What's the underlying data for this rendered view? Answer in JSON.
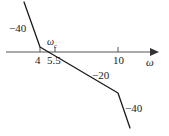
{
  "chart_data": {
    "type": "line",
    "title": "",
    "subtitle": "",
    "xlabel": "ω",
    "ylabel": "",
    "grid": false,
    "legend": null,
    "x_ticks": [
      {
        "value": 4,
        "label": "4"
      },
      {
        "value": 5.5,
        "label": "5.5"
      },
      {
        "value": 10,
        "label": "10"
      }
    ],
    "y_ticks": [],
    "annotations": [
      {
        "id": "slope-first",
        "label": "−40",
        "meaning": "-40 dB/dec slope of first asymptote segment",
        "px": {
          "x": 9,
          "y": 23
        }
      },
      {
        "id": "crossover",
        "label": "ωc",
        "meaning": "gain crossover frequency marker",
        "px": {
          "x": 47,
          "y": 37
        }
      },
      {
        "id": "slope-second",
        "label": "−20",
        "meaning": "-20 dB/dec slope of middle asymptote segment",
        "px": {
          "x": 92,
          "y": 70
        }
      },
      {
        "id": "slope-third",
        "label": "−40",
        "meaning": "-40 dB/dec slope of final asymptote segment",
        "px": {
          "x": 125,
          "y": 103
        }
      },
      {
        "id": "axis-name",
        "label": "ω",
        "meaning": "frequency axis label",
        "px": {
          "x": 146,
          "y": 57
        }
      }
    ],
    "series": [
      {
        "name": "magnitude-asymptote",
        "breakpoints": [
          {
            "omega": 2.6,
            "note": "segment start (top left)",
            "px": {
              "x": 24,
              "y": 2
            }
          },
          {
            "omega": 4,
            "note": "corner at ω = 4",
            "px": {
              "x": 40,
              "y": 47
            }
          },
          {
            "omega": 10,
            "note": "corner at ω = 10",
            "px": {
              "x": 118,
              "y": 93
            }
          },
          {
            "omega": 13.5,
            "note": "segment end (bottom right)",
            "px": {
              "x": 130,
              "y": 128
            }
          }
        ],
        "segment_slopes": [
          "-40",
          "-20",
          "-40"
        ]
      }
    ],
    "axis_geometry": {
      "axis_y_px": 52,
      "axis_x_start_px": 6,
      "axis_x_end_px": 158,
      "tick_px": {
        "4": 40,
        "5.5": 55,
        "10": 118
      },
      "crossover_px": 57
    },
    "colors": {
      "line": "#1a1a1a",
      "axis": "#555555",
      "text": "#1a1a1a",
      "background": "#ffffff"
    }
  },
  "labels": {
    "minus40_top": "−40",
    "minus20": "−20",
    "minus40_bottom": "−40",
    "tick_4": "4",
    "tick_55": "5.5",
    "tick_10": "10",
    "omega_axis": "ω",
    "omega_c": "ω",
    "omega_c_sub": "c"
  }
}
